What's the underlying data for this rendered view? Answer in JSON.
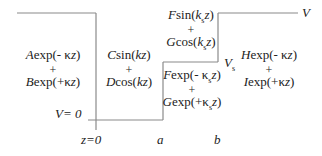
{
  "diagram": {
    "type": "potential-profile",
    "line_color": "#8a8a8a",
    "regions": [
      {
        "id": "region-1",
        "terms": [
          "Aexp(- κz)",
          "Bexp(+κz)"
        ]
      },
      {
        "id": "region-2",
        "terms": [
          "Csin(kz)",
          "Dcos(kz)"
        ]
      },
      {
        "id": "region-3-upper",
        "terms": [
          "Fsin(k_s z)",
          "Gcos(k_s z)"
        ]
      },
      {
        "id": "region-3-lower",
        "terms": [
          "Fexp(- κ_s z)",
          "Gexp(+κ_s z)"
        ]
      },
      {
        "id": "region-4",
        "terms": [
          "Hexp(- κz)",
          "Iexp(+κz)"
        ]
      }
    ],
    "plus": "+",
    "labels": {
      "v_zero": "V= 0",
      "v_top": "V",
      "v_s": "V",
      "v_s_sub": "s",
      "z_zero": "z=0",
      "a": "a",
      "b": "b"
    }
  }
}
